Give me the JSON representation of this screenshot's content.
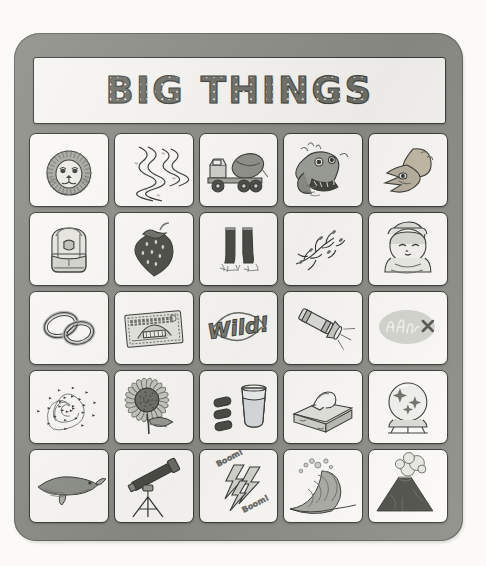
{
  "page": {
    "background_color": "#fbfaf7",
    "card_color": "#8b8d86",
    "cell_color": "#fcfbf8",
    "ink_color": "#3b3c38"
  },
  "title": {
    "text": "BIG THINGS",
    "style": "marquee-bulb-lettering"
  },
  "grid": {
    "rows": 5,
    "columns": 5,
    "cells": [
      {
        "row": 1,
        "col": 1,
        "icon_name": "lion-head-icon",
        "label": "Lion"
      },
      {
        "row": 1,
        "col": 2,
        "icon_name": "river-snake-icon",
        "label": "River"
      },
      {
        "row": 1,
        "col": 3,
        "icon_name": "cement-truck-icon",
        "label": "Cement Truck"
      },
      {
        "row": 1,
        "col": 4,
        "icon_name": "dragon-head-icon",
        "label": "Dragon"
      },
      {
        "row": 1,
        "col": 5,
        "icon_name": "dinosaur-skull-icon",
        "label": "Dinosaur Skull"
      },
      {
        "row": 2,
        "col": 1,
        "icon_name": "backpack-icon",
        "label": "Backpack"
      },
      {
        "row": 2,
        "col": 2,
        "icon_name": "strawberry-icon",
        "label": "Strawberry"
      },
      {
        "row": 2,
        "col": 3,
        "icon_name": "rain-boots-icon",
        "label": "Rain Boots"
      },
      {
        "row": 2,
        "col": 4,
        "icon_name": "branches-icon",
        "label": "Branches"
      },
      {
        "row": 2,
        "col": 5,
        "icon_name": "swaddled-baby-icon",
        "label": "Baby"
      },
      {
        "row": 3,
        "col": 1,
        "icon_name": "wedding-rings-icon",
        "label": "Rings"
      },
      {
        "row": 3,
        "col": 2,
        "icon_name": "banknote-ticket-icon",
        "label": "Ticket"
      },
      {
        "row": 3,
        "col": 3,
        "icon_name": "wild-logo-icon",
        "label": "Wild!",
        "caption": "Wild!"
      },
      {
        "row": 3,
        "col": 4,
        "icon_name": "flashlight-icon",
        "label": "Flashlight"
      },
      {
        "row": 3,
        "col": 5,
        "icon_name": "graffiti-scribble-icon",
        "label": "Graffiti"
      },
      {
        "row": 4,
        "col": 1,
        "icon_name": "hurricane-spiral-icon",
        "label": "Hurricane"
      },
      {
        "row": 4,
        "col": 2,
        "icon_name": "sunflower-icon",
        "label": "Sunflower"
      },
      {
        "row": 4,
        "col": 3,
        "icon_name": "pills-and-water-icon",
        "label": "Pills and Water"
      },
      {
        "row": 4,
        "col": 4,
        "icon_name": "tissue-box-icon",
        "label": "Tissue Box"
      },
      {
        "row": 4,
        "col": 5,
        "icon_name": "crystal-ball-icon",
        "label": "Crystal Ball"
      },
      {
        "row": 5,
        "col": 1,
        "icon_name": "whale-icon",
        "label": "Whale"
      },
      {
        "row": 5,
        "col": 2,
        "icon_name": "telescope-icon",
        "label": "Telescope"
      },
      {
        "row": 5,
        "col": 3,
        "icon_name": "lightning-bolts-icon",
        "label": "Lightning",
        "caption": "Boom!",
        "caption2": "Boom!"
      },
      {
        "row": 5,
        "col": 4,
        "icon_name": "ocean-wave-icon",
        "label": "Wave"
      },
      {
        "row": 5,
        "col": 5,
        "icon_name": "volcano-icon",
        "label": "Volcano"
      }
    ]
  }
}
